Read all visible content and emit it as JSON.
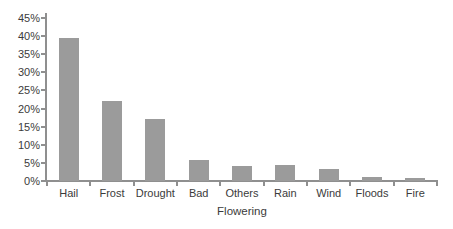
{
  "chart_data": {
    "type": "bar",
    "title": "",
    "xlabel": "Flowering",
    "ylabel": "",
    "categories": [
      "Hail",
      "Frost",
      "Drought",
      "Bad",
      "Others",
      "Rain",
      "Wind",
      "Floods",
      "Fire"
    ],
    "values": [
      39.5,
      22.2,
      17.0,
      5.9,
      4.1,
      4.3,
      3.4,
      1.1,
      0.8
    ],
    "ylim": [
      0,
      45
    ],
    "ytick_step": 5,
    "ytick_labels": [
      "0%",
      "5%",
      "10%",
      "15%",
      "20%",
      "25%",
      "30%",
      "35%",
      "40%",
      "45%"
    ],
    "grid": false,
    "legend": false,
    "bar_color": "#9b9b9b",
    "axis_color": "#8f8f8f",
    "text_color": "#3b3b3b",
    "background_color": "#ffffff"
  }
}
